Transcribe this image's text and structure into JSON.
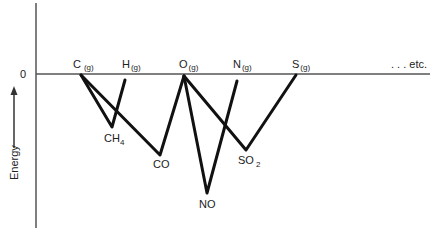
{
  "diagram": {
    "type": "energy-level-diagram",
    "y_axis_label": "Energy",
    "zero_label": "0",
    "continuation_label": ". . . etc.",
    "elements": [
      {
        "symbol": "C",
        "state": "(g)"
      },
      {
        "symbol": "H",
        "state": "(g)"
      },
      {
        "symbol": "O",
        "state": "(g)"
      },
      {
        "symbol": "N",
        "state": "(g)"
      },
      {
        "symbol": "S",
        "state": "(g)"
      }
    ],
    "compounds": [
      {
        "formula": "CH",
        "subscript": "4",
        "from": [
          "C",
          "H"
        ]
      },
      {
        "formula": "CO",
        "subscript": "",
        "from": [
          "C",
          "O"
        ]
      },
      {
        "formula": "NO",
        "subscript": "",
        "from": [
          "O",
          "N"
        ]
      },
      {
        "formula": "SO",
        "subscript": "2",
        "from": [
          "O",
          "S"
        ]
      }
    ]
  }
}
